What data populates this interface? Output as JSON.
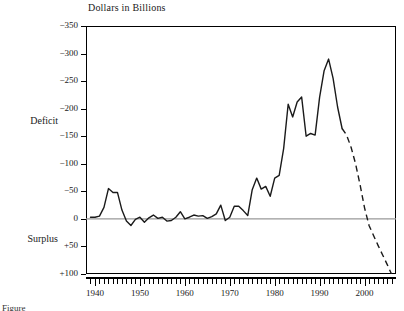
{
  "chart_data": {
    "type": "line",
    "title": "Dollars in Billions",
    "xlabel": "",
    "ylabel": "Dollars in Billions",
    "axis_orientation": "y-inverted (deficit plotted upward)",
    "grid": false,
    "legend": false,
    "legend_position": "none",
    "xlim": [
      1938,
      2007
    ],
    "ylim": [
      -350,
      100
    ],
    "ytick_labels": [
      "-350",
      "-300",
      "-250",
      "-200",
      "-150",
      "-100",
      "-50",
      "0",
      "+50",
      "+100"
    ],
    "ytick_values": [
      -350,
      -300,
      -250,
      -200,
      -150,
      -100,
      -50,
      0,
      50,
      100
    ],
    "xtick_labels": [
      "1940",
      "1950",
      "1960",
      "1970",
      "1980",
      "1990",
      "2000"
    ],
    "xtick_values": [
      1940,
      1950,
      1960,
      1970,
      1980,
      1990,
      2000
    ],
    "xtick_minor_interval": 1,
    "region_labels": [
      {
        "text": "Deficit",
        "value": -175
      },
      {
        "text": "Surplus",
        "value": 50
      }
    ],
    "zero_line": 0,
    "series": [
      {
        "name": "Actual deficit/surplus",
        "style": "solid",
        "x": [
          1939,
          1940,
          1941,
          1942,
          1943,
          1944,
          1945,
          1946,
          1947,
          1948,
          1949,
          1950,
          1951,
          1952,
          1953,
          1954,
          1955,
          1956,
          1957,
          1958,
          1959,
          1960,
          1961,
          1962,
          1963,
          1964,
          1965,
          1966,
          1967,
          1968,
          1969,
          1970,
          1971,
          1972,
          1973,
          1974,
          1975,
          1976,
          1977,
          1978,
          1979,
          1980,
          1981,
          1982,
          1983,
          1984,
          1985,
          1986,
          1987,
          1988,
          1989,
          1990,
          1991,
          1992,
          1993,
          1994,
          1995
        ],
        "values": [
          -3,
          -3,
          -5,
          -21,
          -55,
          -48,
          -48,
          -16,
          4,
          12,
          1,
          -3,
          6,
          -2,
          -7,
          -1,
          -3,
          4,
          3,
          -3,
          -13,
          0,
          -3,
          -7,
          -5,
          -6,
          -1,
          -4,
          -9,
          -25,
          3,
          -3,
          -23,
          -23,
          -15,
          -6,
          -53,
          -74,
          -54,
          -59,
          -41,
          -74,
          -79,
          -128,
          -208,
          -185,
          -212,
          -221,
          -150,
          -155,
          -152,
          -221,
          -269,
          -290,
          -255,
          -203,
          -164
        ]
      },
      {
        "name": "Projected deficit/surplus",
        "style": "dashed",
        "x": [
          1995,
          1996,
          1997,
          1998,
          1999,
          2000,
          2001,
          2002,
          2003,
          2004,
          2005,
          2006
        ],
        "values": [
          -164,
          -152,
          -130,
          -100,
          -62,
          -20,
          12,
          30,
          48,
          65,
          82,
          100
        ]
      }
    ]
  },
  "annotations": {
    "caption_fragment": "Figure"
  },
  "colors": {
    "line": "#1a1a1a",
    "zero_line": "#999999",
    "frame": "#000000",
    "background": "#ffffff"
  }
}
